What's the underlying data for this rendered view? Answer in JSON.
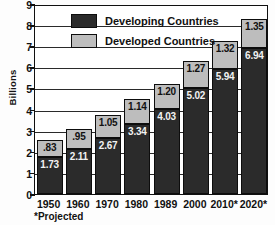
{
  "chart_data": {
    "type": "bar",
    "stacked": true,
    "title": "",
    "xlabel": "",
    "ylabel": "Billions",
    "ylim": [
      0,
      9
    ],
    "yticks": [
      "0",
      "1",
      "2",
      "3",
      "4",
      "5",
      "6",
      "7",
      "8",
      "9"
    ],
    "grid": true,
    "legend_position": "top-left",
    "categories": [
      "1950",
      "1960",
      "1970",
      "1980",
      "1989",
      "2000",
      "2010*",
      "2020*"
    ],
    "series": [
      {
        "name": "Developing Countries",
        "color": "#2b2b2b",
        "values": [
          1.73,
          2.11,
          2.67,
          3.34,
          4.03,
          5.02,
          5.94,
          6.94
        ],
        "labels": [
          "1.73",
          "2.11",
          "2.67",
          "3.34",
          "4.03",
          "5.02",
          "5.94",
          "6.94"
        ]
      },
      {
        "name": "Developed Countries",
        "color": "#bdbdbd",
        "values": [
          0.83,
          0.95,
          1.05,
          1.14,
          1.2,
          1.27,
          1.32,
          1.35
        ],
        "labels": [
          ".83",
          ".95",
          "1.05",
          "1.14",
          "1.20",
          "1.27",
          "1.32",
          "1.35"
        ]
      }
    ],
    "totals": [
      2.56,
      3.06,
      3.72,
      4.48,
      5.23,
      6.29,
      7.26,
      8.29
    ],
    "footnote": "*Projected"
  },
  "axis": {
    "y_title": "Billions",
    "y_ticks": [
      "9",
      "8",
      "7",
      "6",
      "5",
      "4",
      "3",
      "2",
      "1",
      "0"
    ],
    "x_ticks": [
      "1950",
      "1960",
      "1970",
      "1980",
      "1989",
      "2000",
      "2010*",
      "2020*"
    ]
  },
  "legend": {
    "items": [
      {
        "label": "Developing Countries",
        "swatch": "dark"
      },
      {
        "label": "Developed Countries",
        "swatch": "gray"
      }
    ]
  },
  "footnote": "*Projected",
  "bar_labels": {
    "top": [
      ".83",
      ".95",
      "1.05",
      "1.14",
      "1.20",
      "1.27",
      "1.32",
      "1.35"
    ],
    "bottom": [
      "1.73",
      "2.11",
      "2.67",
      "3.34",
      "4.03",
      "5.02",
      "5.94",
      "6.94"
    ]
  }
}
